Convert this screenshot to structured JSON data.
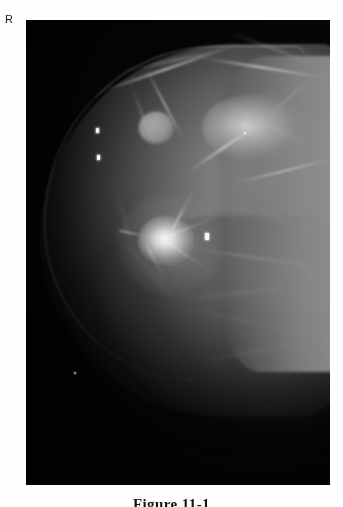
{
  "page": {
    "background_color": "#fefefe",
    "width": 343,
    "height": 507
  },
  "laterality_marker": {
    "label": "R",
    "meaning": "right-breast-marker",
    "color": "#1a1a1a"
  },
  "film": {
    "modality": "mammogram",
    "view": "craniocaudal",
    "border_color": "#050505",
    "background_color": "#020202",
    "highlight_color": "#fcfcfc",
    "tissue_color": "#9c9c9c"
  },
  "findings": [
    {
      "name": "round-circumscribed-mass",
      "x": 113,
      "y": 92,
      "width": 34,
      "height": 31
    },
    {
      "name": "spiculated-lesion",
      "x": 112,
      "y": 196,
      "width": 56,
      "height": 50
    },
    {
      "name": "dense-fibroglandular-island",
      "x": 176,
      "y": 74,
      "width": 104,
      "height": 66
    }
  ],
  "markers": [
    {
      "name": "radiopaque-marker-upper",
      "x": 70,
      "y": 108,
      "width": 3,
      "height": 5
    },
    {
      "name": "radiopaque-marker-mid",
      "x": 71,
      "y": 135,
      "width": 3,
      "height": 5
    },
    {
      "name": "radiopaque-marker-lesion",
      "x": 179,
      "y": 213,
      "width": 4,
      "height": 7
    },
    {
      "name": "microcalcification-lower",
      "x": 48,
      "y": 352,
      "width": 2,
      "height": 2
    },
    {
      "name": "microcalcification-upper",
      "x": 218,
      "y": 112,
      "width": 2,
      "height": 2
    }
  ],
  "caption": {
    "text": "Figure 11-1",
    "clipped": true
  }
}
